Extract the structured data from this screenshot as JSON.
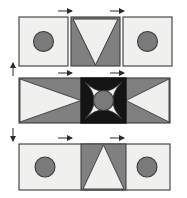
{
  "figure": {
    "type": "geometric-diagram",
    "title": "",
    "canvas": {
      "width": 187,
      "height": 198,
      "background": "#ffffff"
    }
  },
  "palette": {
    "light": "#f0f0ee",
    "gray": "#808080",
    "dark_gray": "#6e6e6e",
    "circle": "#7a7a7a",
    "black": "#141414",
    "outline": "#3a3a3a",
    "arrow": "#2b2b2b",
    "background": "#ffffff"
  },
  "rows": [
    {
      "id": "top-row",
      "continuous": false,
      "y": 17,
      "height": 49,
      "panels": [
        {
          "id": "top-left",
          "motif": "circle",
          "fill": "light",
          "x": 19,
          "width": 49
        },
        {
          "id": "top-center",
          "motif": "triangle-down",
          "fill": "gray",
          "x": 71,
          "width": 49
        },
        {
          "id": "top-right",
          "motif": "circle",
          "fill": "light",
          "x": 123,
          "width": 49
        }
      ]
    },
    {
      "id": "middle-row",
      "continuous": true,
      "y": 78,
      "height": 45,
      "panels": [
        {
          "id": "mid-left",
          "motif": "triangle-right",
          "fill": "gray",
          "x": 19,
          "width": 62
        },
        {
          "id": "mid-center",
          "motif": "star-circle",
          "fill": "black",
          "x": 81,
          "width": 45
        },
        {
          "id": "mid-right",
          "motif": "triangle-left",
          "fill": "gray",
          "x": 126,
          "width": 44
        }
      ]
    },
    {
      "id": "bottom-row",
      "continuous": true,
      "y": 144,
      "height": 46,
      "panels": [
        {
          "id": "bottom-left",
          "motif": "circle",
          "fill": "light",
          "x": 19,
          "width": 62
        },
        {
          "id": "bottom-center",
          "motif": "triangle-up",
          "fill": "gray",
          "x": 81,
          "width": 45
        },
        {
          "id": "bottom-right",
          "motif": "circle",
          "fill": "light",
          "x": 126,
          "width": 44
        }
      ]
    }
  ],
  "annotations": {
    "dimension_arrows": [
      {
        "id": "arrow-top-left",
        "orientation": "horizontal",
        "direction": "right",
        "x": 67,
        "y": 11
      },
      {
        "id": "arrow-top-right",
        "orientation": "horizontal",
        "direction": "right",
        "x": 119,
        "y": 11
      },
      {
        "id": "arrow-mid-left",
        "orientation": "horizontal",
        "direction": "right",
        "x": 67,
        "y": 73
      },
      {
        "id": "arrow-mid-right",
        "orientation": "horizontal",
        "direction": "right",
        "x": 119,
        "y": 73
      },
      {
        "id": "arrow-bottom-left",
        "orientation": "horizontal",
        "direction": "right",
        "x": 67,
        "y": 138
      },
      {
        "id": "arrow-bottom-right",
        "orientation": "horizontal",
        "direction": "right",
        "x": 119,
        "y": 138
      },
      {
        "id": "arrow-side-upper",
        "orientation": "vertical",
        "direction": "up",
        "x": 13,
        "y": 62
      },
      {
        "id": "arrow-side-lower",
        "orientation": "vertical",
        "direction": "down",
        "x": 13,
        "y": 122
      }
    ],
    "labels": []
  }
}
